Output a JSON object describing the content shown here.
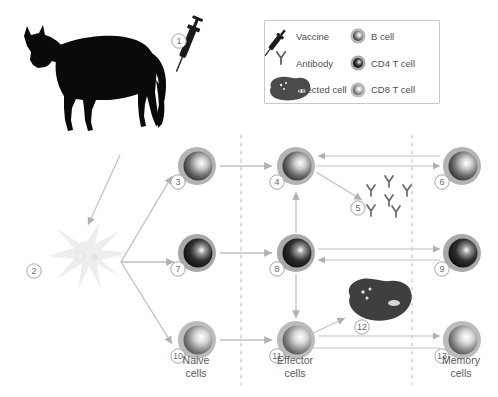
{
  "figure": {
    "background": "#ffffff",
    "accent": "#9a9a9a"
  },
  "legend": {
    "box": {
      "x": 264,
      "y": 20,
      "w": 174,
      "h": 82
    },
    "items": [
      {
        "id": "vaccine",
        "icon": "syringe-icon",
        "label": "Vaccine",
        "col": 0,
        "row": 0
      },
      {
        "id": "antibody",
        "icon": "antibody-icon",
        "label": "Antibody",
        "col": 0,
        "row": 1
      },
      {
        "id": "infected-cell",
        "icon": "infected-cell-icon",
        "label": "Infected cell",
        "col": 0,
        "row": 2
      },
      {
        "id": "b-cell",
        "icon": "b-cell-icon",
        "label": "B cell",
        "col": 1,
        "row": 0
      },
      {
        "id": "cd4-t-cell",
        "icon": "cd4-t-cell-icon",
        "label": "CD4 T cell",
        "col": 1,
        "row": 1
      },
      {
        "id": "cd8-t-cell",
        "icon": "cd8-t-cell-icon",
        "label": "CD8 T cell",
        "col": 1,
        "row": 2
      }
    ]
  },
  "markers": [
    {
      "n": "1",
      "x": 179,
      "y": 41
    },
    {
      "n": "2",
      "x": 34,
      "y": 271
    },
    {
      "n": "3",
      "x": 178,
      "y": 182
    },
    {
      "n": "4",
      "x": 277,
      "y": 182
    },
    {
      "n": "5",
      "x": 358,
      "y": 208
    },
    {
      "n": "6",
      "x": 442,
      "y": 182
    },
    {
      "n": "7",
      "x": 178,
      "y": 269
    },
    {
      "n": "8",
      "x": 277,
      "y": 269
    },
    {
      "n": "9",
      "x": 442,
      "y": 269
    },
    {
      "n": "10",
      "x": 178,
      "y": 356
    },
    {
      "n": "11",
      "x": 277,
      "y": 356
    },
    {
      "n": "12",
      "x": 362,
      "y": 327
    },
    {
      "n": "13",
      "x": 442,
      "y": 356
    }
  ],
  "cells": [
    {
      "id": "b-naive",
      "type": "b-cell",
      "x": 197,
      "y": 166
    },
    {
      "id": "b-effector",
      "type": "b-cell",
      "x": 296,
      "y": 166
    },
    {
      "id": "b-memory",
      "type": "b-cell",
      "x": 462,
      "y": 166
    },
    {
      "id": "cd4-naive",
      "type": "cd4-t-cell",
      "x": 197,
      "y": 253
    },
    {
      "id": "cd4-effector",
      "type": "cd4-t-cell",
      "x": 296,
      "y": 253
    },
    {
      "id": "cd4-memory",
      "type": "cd4-t-cell",
      "x": 462,
      "y": 253
    },
    {
      "id": "cd8-naive",
      "type": "cd8-t-cell",
      "x": 197,
      "y": 340
    },
    {
      "id": "cd8-effector",
      "type": "cd8-t-cell",
      "x": 296,
      "y": 340
    },
    {
      "id": "cd8-memory",
      "type": "cd8-t-cell",
      "x": 462,
      "y": 340
    }
  ],
  "column_labels": [
    {
      "id": "naive",
      "line1": "Naive",
      "line2": "cells",
      "x": 196,
      "y": 364
    },
    {
      "id": "effector",
      "line1": "Effector",
      "line2": "cells",
      "x": 295,
      "y": 364
    },
    {
      "id": "memory",
      "line1": "Memory",
      "line2": "cells",
      "x": 461,
      "y": 364
    }
  ],
  "dividers": [
    {
      "id": "divider-naive-effector",
      "x": 241,
      "y1": 135,
      "y2": 385
    },
    {
      "id": "divider-effector-memory",
      "x": 412,
      "y1": 135,
      "y2": 385
    }
  ],
  "antibody_cluster": {
    "id": "antibody-cluster",
    "positions": [
      {
        "x": 371,
        "y": 190
      },
      {
        "x": 389,
        "y": 182
      },
      {
        "x": 406,
        "y": 190
      },
      {
        "x": 389,
        "y": 199
      },
      {
        "x": 371,
        "y": 208
      },
      {
        "x": 394,
        "y": 210
      }
    ]
  },
  "infected_cell": {
    "id": "infected-cell",
    "x": 356,
    "y": 288,
    "w": 62,
    "h": 42
  },
  "horse": {
    "id": "horse-silhouette",
    "x": 10,
    "y": 14,
    "w": 175,
    "h": 118
  },
  "syringe": {
    "id": "syringe-icon",
    "x": 186,
    "y": 22
  },
  "dendritic_cell": {
    "id": "dendritic-cell",
    "x": 48,
    "y": 222,
    "w": 80,
    "h": 70
  }
}
